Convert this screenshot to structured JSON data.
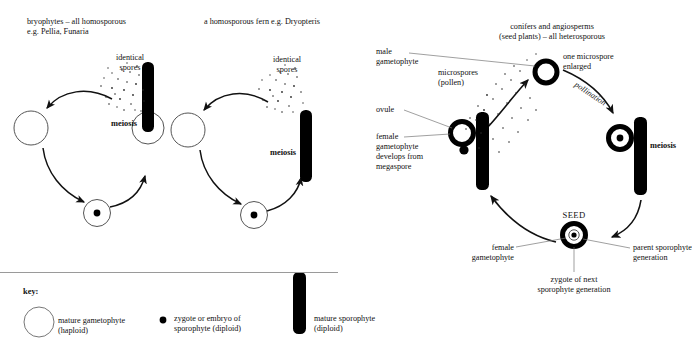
{
  "figure": {
    "title_visible": false,
    "colors": {
      "ink": "#111111",
      "fill_black": "#000000",
      "outline": "#555555",
      "rule": "#9a9a9a"
    }
  },
  "panels": [
    {
      "id": "bryophytes",
      "heading_line1": "bryophytes – all homosporous",
      "heading_line2_plain": "e.g. ",
      "heading_line2_italic": "Pellia, Funaria",
      "spores_label_line1": "identical",
      "spores_label_line2": "spores",
      "meiosis_label": "meiosis"
    },
    {
      "id": "fern",
      "heading_plain": "a homosporous fern e.g. ",
      "heading_italic": "Dryopteris",
      "spores_label_line1": "identical",
      "spores_label_line2": "spores",
      "meiosis_label": "meiosis"
    },
    {
      "id": "seed-plants",
      "heading_line1": "conifers and angiosperms",
      "heading_line2": "(seed plants) – all heterosporous",
      "male_gametophyte_line1": "male",
      "male_gametophyte_line2": "gametophyte",
      "microspores_line1": "microspores",
      "microspores_line2": "(pollen)",
      "one_microspore_line1": "one microspore",
      "one_microspore_line2": "enlarged",
      "pollination_label": "pollination",
      "ovule_label": "ovule",
      "female_gam_line1": "female",
      "female_gam_line2": "gametophyte",
      "female_gam_line3": "develops from",
      "female_gam_line4": "megaspore",
      "meiosis_label": "meiosis",
      "seed_label": "SEED",
      "seed_female_line1": "female",
      "seed_female_line2": "gametophyte",
      "seed_parent_line1": "parent sporophyte",
      "seed_parent_line2": "generation",
      "seed_zygote_line1": "zygote of next",
      "seed_zygote_line2": "sporophyte generation"
    }
  ],
  "key": {
    "title": "key:",
    "items": [
      {
        "glyph": "open-circle",
        "line1": "mature gametophyte",
        "line2": "(haploid)"
      },
      {
        "glyph": "filled-dot",
        "line1": "zygote or embryo of",
        "line2": "sporophyte (diploid)"
      },
      {
        "glyph": "black-bar",
        "line1": "mature sporophyte",
        "line2": "(diploid)"
      }
    ]
  }
}
